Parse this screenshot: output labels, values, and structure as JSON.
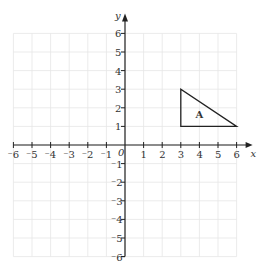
{
  "header_text_clipped": "",
  "diagram": {
    "type": "coordinate-grid",
    "x_axis": {
      "label": "x",
      "min": -6,
      "max": 6,
      "ticks": [
        "-6",
        "-5",
        "-4",
        "-3",
        "-2",
        "-1",
        "1",
        "2",
        "3",
        "4",
        "5",
        "6"
      ]
    },
    "y_axis": {
      "label": "y",
      "min": -6,
      "max": 6,
      "ticks": [
        "6",
        "5",
        "4",
        "3",
        "2",
        "1",
        "-1",
        "-2",
        "-3",
        "-4",
        "-5",
        "-6"
      ]
    },
    "origin_label": "0",
    "shapes": [
      {
        "name": "A",
        "type": "triangle",
        "vertices": [
          [
            3,
            1
          ],
          [
            3,
            3
          ],
          [
            6,
            1
          ]
        ]
      }
    ],
    "colors": {
      "grid": "#e6e6e6",
      "axis": "#222222",
      "shape": "#222222"
    }
  }
}
